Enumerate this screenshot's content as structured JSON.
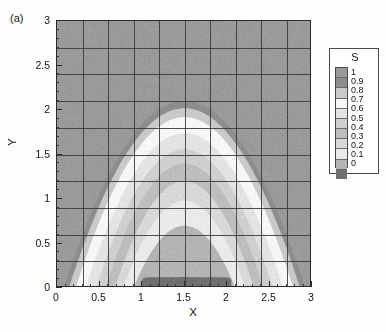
{
  "panel": {
    "label": "(a)"
  },
  "axes": {
    "x_title": "X",
    "y_title": "Y",
    "x_ticks": [
      "0",
      "0.5",
      "1",
      "1.5",
      "2",
      "2.5",
      "3"
    ],
    "y_ticks": [
      "0",
      "0.5",
      "1",
      "1.5",
      "2",
      "2.5",
      "3"
    ]
  },
  "legend": {
    "title": "S",
    "labels": [
      "1",
      "0.9",
      "0.8",
      "0.7",
      "0.6",
      "0.5",
      "0.4",
      "0.3",
      "0.2",
      "0.1",
      "0"
    ]
  },
  "palette": {
    "level_1_0": "#9a9a9a",
    "level_0_9": "#8d8d8d",
    "level_0_8": "#c9c9c9",
    "level_0_7": "#f6f6f6",
    "level_0_6": "#e3e3e3",
    "level_0_5": "#cfcfcf",
    "level_0_4": "#bdbdbd",
    "level_0_3": "#d8d8d8",
    "level_0_2": "#eaeaea",
    "level_0_1": "#b4b4b4",
    "level_0_0": "#6f6f6f",
    "mesh_line": "#3a3a3a",
    "frame": "#2a2a2a"
  },
  "chart_data": {
    "type": "heatmap",
    "title": "",
    "subtitle": "",
    "xlabel": "X",
    "ylabel": "Y",
    "xlim": [
      0,
      3
    ],
    "ylim": [
      0,
      3
    ],
    "xticks": [
      0,
      0.5,
      1,
      1.5,
      2,
      2.5,
      3
    ],
    "yticks": [
      0,
      0.5,
      1,
      1.5,
      2,
      2.5,
      3
    ],
    "grid": true,
    "grid_nx": 10,
    "grid_ny": 10,
    "legend": {
      "position": "right",
      "title": "S",
      "levels": [
        0,
        0.1,
        0.2,
        0.3,
        0.4,
        0.5,
        0.6,
        0.7,
        0.8,
        0.9,
        1
      ],
      "colors": [
        "#6f6f6f",
        "#b4b4b4",
        "#eaeaea",
        "#d8d8d8",
        "#bdbdbd",
        "#cfcfcf",
        "#e3e3e3",
        "#f6f6f6",
        "#c9c9c9",
        "#8d8d8d",
        "#9a9a9a"
      ]
    },
    "colorscale": "grayscale-banded",
    "zmin": 0,
    "zmax": 1,
    "field_description": "Scalar S forming a dome/parabolic plume centred at x=1.5 rising to y~2.1, with nested contour bands and a low-S (S~0) dark pocket along the bottom wall between x=1 and x=2.",
    "field_model": {
      "kind": "nested-dome-bands",
      "center_x": 1.5,
      "dome_apex_y": 2.1,
      "dome_half_width": 1.42,
      "background_value": 1.0,
      "bottom_pocket": {
        "x_range": [
          1.0,
          2.05
        ],
        "y_range": [
          0,
          0.12
        ],
        "value": 0.0
      },
      "bands": [
        {
          "value": 0.9,
          "apex_y": 2.1,
          "half_width": 1.42
        },
        {
          "value": 0.8,
          "apex_y": 2.02,
          "half_width": 1.36
        },
        {
          "value": 0.7,
          "apex_y": 1.92,
          "half_width": 1.28
        },
        {
          "value": 0.6,
          "apex_y": 1.74,
          "half_width": 1.16
        },
        {
          "value": 0.5,
          "apex_y": 1.56,
          "half_width": 1.04
        },
        {
          "value": 0.4,
          "apex_y": 1.4,
          "half_width": 0.93
        },
        {
          "value": 0.3,
          "apex_y": 1.2,
          "half_width": 0.82
        },
        {
          "value": 0.2,
          "apex_y": 0.98,
          "half_width": 0.72
        },
        {
          "value": 0.1,
          "apex_y": 0.7,
          "half_width": 0.6
        },
        {
          "value": 0.0,
          "apex_y": 0.12,
          "half_width": 0.52
        }
      ]
    }
  }
}
